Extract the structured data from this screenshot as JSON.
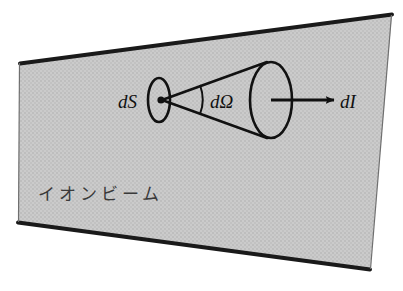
{
  "figure": {
    "caption_region_label": "ion-beam-solid-angle-diagram",
    "background_color": "#ffffff",
    "beam_fill_color": "#c9c9c9",
    "beam_texture_color": "#bdbdbd",
    "stroke_color": "#111111",
    "labels": {
      "source_area": "dS",
      "solid_angle": "dΩ",
      "intensity": "dI",
      "beam": "イオンビーム"
    },
    "geometry": {
      "beam_polygon": "20,63 392,14 370,270 18,222",
      "small_ellipse": {
        "cx": 159,
        "cy": 100,
        "rx": 11,
        "ry": 22
      },
      "large_ellipse": {
        "cx": 271,
        "cy": 100,
        "rx": 21,
        "ry": 38
      },
      "apex": {
        "x": 162,
        "y": 100
      },
      "cone_upper_edge": "162,100 266,62",
      "cone_lower_edge": "162,100 266,138",
      "angle_arc": "M 200,85 Q 205,100 200,114",
      "arrow_start": {
        "x": 271,
        "y": 100
      },
      "arrow_end": {
        "x": 338,
        "y": 100
      }
    },
    "label_positions": {
      "source_area": {
        "x": 118,
        "y": 108
      },
      "solid_angle": {
        "x": 210,
        "y": 108
      },
      "intensity": {
        "x": 340,
        "y": 108
      },
      "beam": {
        "x": 38,
        "y": 200
      }
    }
  }
}
